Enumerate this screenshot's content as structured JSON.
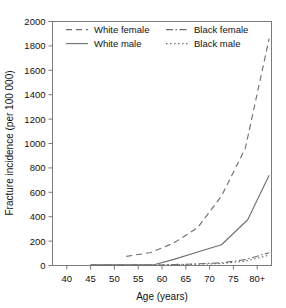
{
  "chart_data": {
    "type": "line",
    "title": "",
    "xlabel": "Age (years)",
    "ylabel": "Fracture incidence (per 100 000)",
    "xlim": [
      37,
      83
    ],
    "ylim": [
      0,
      2000
    ],
    "grid": false,
    "legend_position": "top-inside",
    "xticks": [
      40,
      45,
      50,
      55,
      60,
      65,
      70,
      75,
      80
    ],
    "xtick_labels": [
      "40",
      "45",
      "50",
      "55",
      "60",
      "65",
      "70",
      "75",
      "80+"
    ],
    "yticks": [
      0,
      200,
      400,
      600,
      800,
      1000,
      1200,
      1400,
      1600,
      1800,
      2000
    ],
    "ytick_labels": [
      "0",
      "200",
      "400",
      "600",
      "800",
      "1000",
      "1200",
      "1400",
      "1600",
      "1800",
      "2000"
    ],
    "series": [
      {
        "name": "White female",
        "style": "dashed",
        "dash": "6,4",
        "x": [
          52.5,
          57.5,
          62.5,
          67.5,
          72.5,
          77.5,
          82.5
        ],
        "values": [
          75,
          105,
          185,
          310,
          570,
          960,
          1860
        ]
      },
      {
        "name": "White male",
        "style": "solid",
        "dash": "none",
        "x": [
          45,
          52.5,
          58.5,
          62.5,
          67.5,
          72.5,
          78,
          82.5
        ],
        "values": [
          5,
          5,
          8,
          50,
          110,
          170,
          375,
          740
        ]
      },
      {
        "name": "Black female",
        "style": "dash-dot",
        "dash": "7,2.5,1.5,2.5",
        "x": [
          45,
          52.5,
          58.5,
          62.5,
          67.5,
          72.5,
          77.5,
          82.5
        ],
        "values": [
          3,
          3,
          4,
          8,
          14,
          22,
          48,
          105
        ]
      },
      {
        "name": "Black male",
        "style": "dotted",
        "dash": "1.5,2.5",
        "x": [
          45,
          52.5,
          58.5,
          62.5,
          67.5,
          72.5,
          77.5,
          82.5
        ],
        "values": [
          2,
          2,
          3,
          6,
          10,
          16,
          35,
          85
        ]
      }
    ]
  },
  "legend": {
    "entries": [
      {
        "label": "White female"
      },
      {
        "label": "Black female"
      },
      {
        "label": "White male"
      },
      {
        "label": "Black male"
      }
    ]
  },
  "axes": {
    "x_title": "Age (years)",
    "y_title": "Fracture incidence (per 100 000)"
  }
}
